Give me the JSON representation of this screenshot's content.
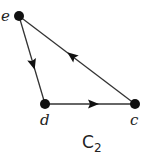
{
  "diagram": {
    "type": "directed-graph",
    "caption": "C",
    "caption_subscript": "2",
    "colors": {
      "edge": "#333333",
      "node": "#111111",
      "text": "#222222"
    },
    "nodes": [
      {
        "id": "e",
        "label": "e",
        "x": 19,
        "y": 16
      },
      {
        "id": "d",
        "label": "d",
        "x": 45,
        "y": 104
      },
      {
        "id": "c",
        "label": "c",
        "x": 135,
        "y": 104
      }
    ],
    "edges": [
      {
        "from": "e",
        "to": "d"
      },
      {
        "from": "d",
        "to": "c"
      },
      {
        "from": "c",
        "to": "e"
      }
    ]
  }
}
